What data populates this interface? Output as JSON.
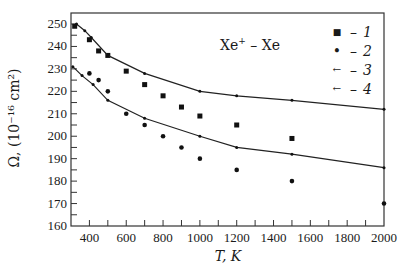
{
  "chart_data": {
    "type": "scatter",
    "title": "",
    "annotation": {
      "base": "Xe",
      "sup": "+",
      "rest": " – Xe"
    },
    "xlabel": "T, K",
    "ylabel": "Ω, (10⁻¹⁶ cm²)",
    "xlim": [
      300,
      2000
    ],
    "ylim": [
      160,
      250
    ],
    "xticks": [
      400,
      600,
      800,
      1000,
      1200,
      1400,
      1600,
      1800,
      2000
    ],
    "xminor_step": 100,
    "yticks": [
      160,
      170,
      180,
      190,
      200,
      210,
      220,
      230,
      240,
      250
    ],
    "yminor_step": 5,
    "grid": false,
    "legend_position": "upper right",
    "series": [
      {
        "name": "1",
        "marker": "square",
        "line": false,
        "points": [
          [
            320,
            249
          ],
          [
            400,
            243
          ],
          [
            450,
            238
          ],
          [
            500,
            236
          ],
          [
            600,
            229
          ],
          [
            700,
            223
          ],
          [
            800,
            218
          ],
          [
            900,
            213
          ],
          [
            1000,
            209
          ],
          [
            1200,
            205
          ],
          [
            1500,
            199
          ]
        ]
      },
      {
        "name": "2",
        "marker": "circle",
        "line": false,
        "points": [
          [
            400,
            228
          ],
          [
            450,
            225
          ],
          [
            500,
            220
          ],
          [
            600,
            210
          ],
          [
            700,
            205
          ],
          [
            800,
            200
          ],
          [
            900,
            195
          ],
          [
            1000,
            190
          ],
          [
            1200,
            185
          ],
          [
            1500,
            180
          ],
          [
            2000,
            170
          ]
        ]
      },
      {
        "name": "3",
        "marker": "tick",
        "line": true,
        "points": [
          [
            310,
            231
          ],
          [
            360,
            227
          ],
          [
            420,
            223
          ],
          [
            500,
            216
          ],
          [
            700,
            208
          ],
          [
            1000,
            200
          ],
          [
            1200,
            195
          ],
          [
            1500,
            192
          ],
          [
            2000,
            186
          ]
        ]
      },
      {
        "name": "4",
        "marker": "tick",
        "line": true,
        "points": [
          [
            330,
            250
          ],
          [
            375,
            247
          ],
          [
            410,
            244
          ],
          [
            500,
            236
          ],
          [
            700,
            228
          ],
          [
            1000,
            220
          ],
          [
            1200,
            218
          ],
          [
            1500,
            216
          ],
          [
            2000,
            212
          ]
        ]
      }
    ]
  },
  "legend": {
    "items": [
      {
        "marker": "■",
        "dash": "–",
        "label": "1"
      },
      {
        "marker": "•",
        "dash": "–",
        "label": "2"
      },
      {
        "marker": "←",
        "dash": "–",
        "label": "3"
      },
      {
        "marker": "←",
        "dash": "–",
        "label": "4"
      }
    ]
  },
  "labels": {
    "annotation_base": "Xe",
    "annotation_sup": "+",
    "annotation_rest": " – Xe",
    "xlabel": "T, K",
    "ylabel": "Ω, (10⁻¹⁶ cm²)"
  }
}
